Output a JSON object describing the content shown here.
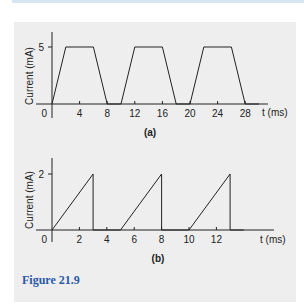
{
  "figure": {
    "caption": "Figure 21.9",
    "caption_color": "#2a5aa8",
    "panel_bg": "#eeeeee",
    "strip_color": "#d6e6f2"
  },
  "chart_data": [
    {
      "type": "line",
      "panel_label": "(a)",
      "title": "",
      "xlabel": "t (ms)",
      "ylabel": "Current (mA)",
      "x_ticks": [
        0,
        4,
        8,
        12,
        16,
        20,
        24,
        28
      ],
      "x_tick_labels": [
        "0",
        "4",
        "8",
        "12",
        "16",
        "20",
        "24",
        "28"
      ],
      "y_ticks": [
        5
      ],
      "y_tick_labels": [
        "5"
      ],
      "xlim": [
        0,
        30
      ],
      "ylim": [
        0,
        6
      ],
      "grid": false,
      "series": [
        {
          "name": "trapezoidal current",
          "x": [
            0,
            2,
            6,
            8,
            10,
            12,
            16,
            18,
            20,
            22,
            26,
            28,
            30
          ],
          "y": [
            0,
            5,
            5,
            0,
            0,
            5,
            5,
            0,
            0,
            5,
            5,
            0,
            0
          ]
        }
      ]
    },
    {
      "type": "line",
      "panel_label": "(b)",
      "title": "",
      "xlabel": "t (ms)",
      "ylabel": "Current (mA)",
      "x_ticks": [
        0,
        2,
        4,
        6,
        8,
        10,
        12
      ],
      "x_tick_labels": [
        "0",
        "2",
        "4",
        "6",
        "8",
        "10",
        "12"
      ],
      "y_ticks": [
        2
      ],
      "y_tick_labels": [
        "2"
      ],
      "xlim": [
        0,
        14
      ],
      "ylim": [
        0,
        2.4
      ],
      "grid": false,
      "series": [
        {
          "name": "sawtooth current",
          "x": [
            0,
            3,
            3,
            5,
            8,
            8,
            10,
            13,
            13,
            14
          ],
          "y": [
            0,
            2,
            0,
            0,
            2,
            0,
            0,
            2,
            0,
            0
          ]
        }
      ]
    }
  ]
}
